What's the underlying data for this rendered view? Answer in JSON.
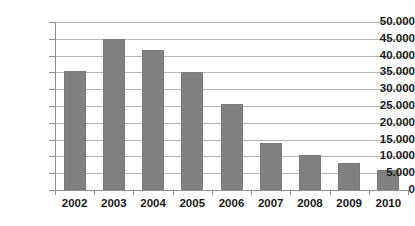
{
  "chart_data": {
    "type": "bar",
    "title": "",
    "subtitle": "",
    "xlabel": "",
    "ylabel": "",
    "categories": [
      "2002",
      "2003",
      "2004",
      "2005",
      "2006",
      "2007",
      "2008",
      "2009",
      "2010"
    ],
    "values": [
      35500,
      44800,
      41800,
      35000,
      25500,
      14000,
      10300,
      8000,
      6000
    ],
    "series": [
      {
        "name": "",
        "values": [
          35500,
          44800,
          41800,
          35000,
          25500,
          14000,
          10300,
          8000,
          6000
        ]
      }
    ],
    "ylim": [
      0,
      50000
    ],
    "ytick_values": [
      0,
      5000,
      10000,
      15000,
      20000,
      25000,
      30000,
      35000,
      40000,
      45000,
      50000
    ],
    "ytick_labels": [
      "0",
      "5.000",
      "10.000",
      "15.000",
      "20.000",
      "25.000",
      "30.000",
      "35.000",
      "40.000",
      "45.000",
      "50.000"
    ],
    "grid": true,
    "grid_axis": "y",
    "legend": false,
    "legend_position": "none",
    "annotations": [],
    "colors": {
      "bar_fill": "#808080",
      "bar_border": "#7a7a7a",
      "grid_line": "#b4b4b4",
      "axis_line": "#8f8f8f",
      "text": "#1a1a1a",
      "background": "#ffffff"
    }
  }
}
